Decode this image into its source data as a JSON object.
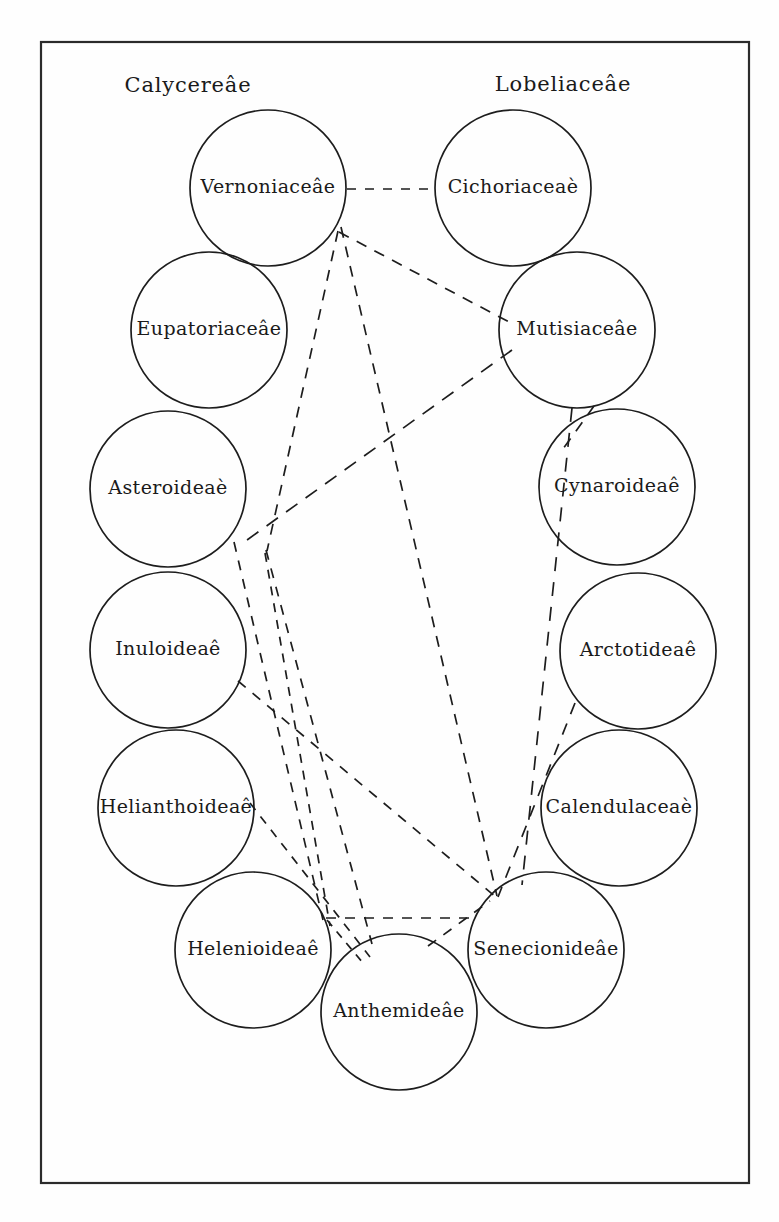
{
  "figure": {
    "type": "relationship-diagram",
    "frame": {
      "x": 41,
      "y": 42,
      "width": 708,
      "height": 1141
    },
    "canvas": {
      "width": 779,
      "height": 1222
    },
    "ink_color": "#1d1d1d",
    "paper_color": "#fefefe"
  },
  "headers": [
    {
      "id": "header-calycereae",
      "label": "Calycereâe",
      "x": 188,
      "y": 86
    },
    {
      "id": "header-lobeliaceae",
      "label": "Lobeliaceâe",
      "x": 563,
      "y": 85
    }
  ],
  "nodes": [
    {
      "id": "vernoniaceae",
      "label": "Vernoniaceâe",
      "cx": 268,
      "cy": 188,
      "r": 78,
      "font": 19
    },
    {
      "id": "cichoriaceae",
      "label": "Cichoriaceaè",
      "cx": 513,
      "cy": 188,
      "r": 78,
      "font": 19
    },
    {
      "id": "eupatoriaceae",
      "label": "Eupatoriaceâe",
      "cx": 209,
      "cy": 330,
      "r": 78,
      "font": 19
    },
    {
      "id": "mutisiaceae",
      "label": "Mutisiaceâe",
      "cx": 577,
      "cy": 330,
      "r": 78,
      "font": 19
    },
    {
      "id": "asteroideae",
      "label": "Asteroideaè",
      "cx": 168,
      "cy": 489,
      "r": 78,
      "font": 19
    },
    {
      "id": "cynaroideae",
      "label": "Cynaroideaê",
      "cx": 617,
      "cy": 487,
      "r": 78,
      "font": 19
    },
    {
      "id": "inuloideae",
      "label": "Inuloideaê",
      "cx": 168,
      "cy": 650,
      "r": 78,
      "font": 19
    },
    {
      "id": "arctotideae",
      "label": "Arctotideaê",
      "cx": 638,
      "cy": 651,
      "r": 78,
      "font": 19
    },
    {
      "id": "helianthoideae",
      "label": "Helianthoideaê",
      "cx": 176,
      "cy": 808,
      "r": 78,
      "font": 19
    },
    {
      "id": "calendulaceae",
      "label": "Calendulaceaè",
      "cx": 619,
      "cy": 808,
      "r": 78,
      "font": 19
    },
    {
      "id": "helenioideae",
      "label": "Helenioideaê",
      "cx": 253,
      "cy": 950,
      "r": 78,
      "font": 19
    },
    {
      "id": "senecionideae",
      "label": "Senecionideâe",
      "cx": 546,
      "cy": 950,
      "r": 78,
      "font": 19
    },
    {
      "id": "anthemideae",
      "label": "Anthemideâe",
      "cx": 399,
      "cy": 1012,
      "r": 78,
      "font": 19
    }
  ],
  "edges": [
    {
      "id": "edge-vernoniaceae-cichoriaceae",
      "from": "vernoniaceae",
      "to": "cichoriaceae",
      "x1": 347,
      "y1": 189,
      "x2": 434,
      "y2": 189,
      "dash": "9 9",
      "width": 1.7
    },
    {
      "id": "edge-vernoniaceae-mutisiaceae",
      "from": "vernoniaceae",
      "to": "mutisiaceae",
      "x1": 339,
      "y1": 232,
      "x2": 509,
      "y2": 322,
      "dash": "11 9",
      "width": 1.7
    },
    {
      "id": "edge-vernoniaceae-senecionideae",
      "from": "vernoniaceae",
      "to": "senecionideae",
      "x1": 341,
      "y1": 227,
      "x2": 497,
      "y2": 896,
      "dash": "11 9",
      "width": 1.7
    },
    {
      "id": "edge-vernoniaceae-hub",
      "from": "vernoniaceae",
      "to": "center-hub",
      "x1": 338,
      "y1": 231,
      "x2": 267,
      "y2": 551,
      "dash": "11 9",
      "width": 1.7
    },
    {
      "id": "edge-mutisiaceae-asteroideae",
      "from": "mutisiaceae",
      "to": "asteroideae",
      "x1": 512,
      "y1": 350,
      "x2": 240,
      "y2": 545,
      "dash": "14 10",
      "width": 1.9
    },
    {
      "id": "edge-mutisiaceae-cynaroideae",
      "from": "mutisiaceae",
      "to": "cynaroideae",
      "x1": 594,
      "y1": 406,
      "x2": 563,
      "y2": 449,
      "dash": "11 9",
      "width": 1.7
    },
    {
      "id": "edge-mutisiaceae-senecionideae",
      "from": "mutisiaceae",
      "to": "senecionideae",
      "x1": 572,
      "y1": 408,
      "x2": 522,
      "y2": 885,
      "dash": "14 11",
      "width": 1.9
    },
    {
      "id": "edge-arctotideae-senecionideae",
      "from": "arctotideae",
      "to": "senecionideae",
      "x1": 575,
      "y1": 703,
      "x2": 498,
      "y2": 897,
      "dash": "12 10",
      "width": 1.8
    },
    {
      "id": "edge-hub-anthemideae",
      "from": "center-hub",
      "to": "anthemideae",
      "x1": 266,
      "y1": 550,
      "x2": 372,
      "y2": 944,
      "dash": "10 9",
      "width": 1.6
    },
    {
      "id": "edge-inuloideae-senecionideae",
      "from": "inuloideae",
      "to": "senecionideae",
      "x1": 238,
      "y1": 681,
      "x2": 497,
      "y2": 898,
      "dash": "10 9",
      "width": 1.6
    },
    {
      "id": "edge-asteroideae-helenioideae",
      "from": "asteroideae",
      "to": "helenioideae",
      "x1": 234,
      "y1": 542,
      "x2": 323,
      "y2": 920,
      "dash": "10 9",
      "width": 1.6
    },
    {
      "id": "edge-helianthoideae-anthemideae",
      "from": "helianthoideae",
      "to": "anthemideae",
      "x1": 250,
      "y1": 803,
      "x2": 370,
      "y2": 957,
      "dash": "9 8",
      "width": 1.5
    },
    {
      "id": "edge-helenioideae-senecionideae",
      "from": "helenioideae",
      "to": "senecionideae",
      "x1": 326,
      "y1": 918,
      "x2": 477,
      "y2": 918,
      "dash": "10 9",
      "width": 1.6
    },
    {
      "id": "edge-helenioideae-anthemideae",
      "from": "helenioideae",
      "to": "anthemideae",
      "x1": 327,
      "y1": 920,
      "x2": 363,
      "y2": 963,
      "dash": "8 7",
      "width": 1.5
    },
    {
      "id": "edge-anthemideae-senecionideae",
      "from": "anthemideae",
      "to": "senecionideae",
      "x1": 428,
      "y1": 946,
      "x2": 490,
      "y2": 901,
      "dash": "10 9",
      "width": 1.6
    },
    {
      "id": "edge-hub-helenioideae-lower",
      "from": "center-hub",
      "to": "helenioideae",
      "x1": 265,
      "y1": 553,
      "x2": 330,
      "y2": 926,
      "dash": "9 8",
      "width": 1.5
    }
  ]
}
